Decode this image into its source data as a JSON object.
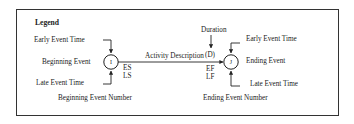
{
  "legend": {
    "title": "Legend",
    "colors": {
      "line": "#222222",
      "background": "#ffffff",
      "border": "#333333"
    },
    "beginning": {
      "early_time_label": "Early Event Time",
      "event_label": "Beginning Event",
      "late_time_label": "Late Event Time",
      "number_label": "Beginning Event Number",
      "node_symbol": "I",
      "early_start": "ES",
      "late_start": "LS"
    },
    "activity": {
      "description_label": "Activity Description",
      "duration_label": "Duration",
      "duration_symbol": "(D)"
    },
    "ending": {
      "early_time_label": "Early Event Time",
      "event_label": "Ending Event",
      "late_time_label": "Late Event Time",
      "number_label": "Ending Event Number",
      "node_symbol": "J",
      "early_finish": "EF",
      "late_finish": "LF"
    }
  }
}
